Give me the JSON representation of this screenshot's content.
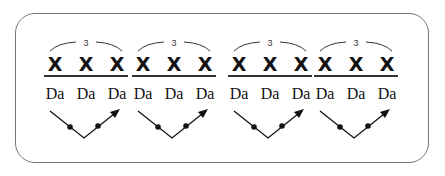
{
  "groups": [
    {
      "tuplet": "3",
      "notes": [
        "X",
        "X",
        "X"
      ],
      "syllables": [
        "Da",
        "Da",
        "Da"
      ],
      "left": 42
    },
    {
      "tuplet": "3",
      "notes": [
        "X",
        "X",
        "X"
      ],
      "syllables": [
        "Da",
        "Da",
        "Da"
      ],
      "left": 130
    },
    {
      "tuplet": "3",
      "notes": [
        "X",
        "X",
        "X"
      ],
      "syllables": [
        "Da",
        "Da",
        "Da"
      ],
      "left": 226
    },
    {
      "tuplet": "3",
      "notes": [
        "X",
        "X",
        "X"
      ],
      "syllables": [
        "Da",
        "Da",
        "Da"
      ],
      "left": 312
    }
  ],
  "colors": {
    "frame": "#777777",
    "ink": "#111111"
  }
}
